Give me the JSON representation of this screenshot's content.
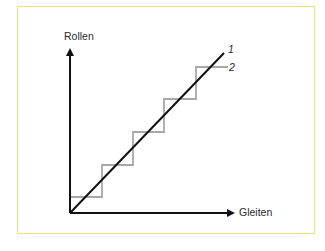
{
  "diagram": {
    "y_axis_label": "Rollen",
    "x_axis_label": "Gleiten",
    "series": [
      {
        "id": "1",
        "label": "1",
        "kind": "straight-line",
        "color": "#111111"
      },
      {
        "id": "2",
        "label": "2",
        "kind": "staircase",
        "color": "#a8a8a8",
        "steps": 5
      }
    ],
    "colors": {
      "frame_border": "#f2e27a",
      "axes": "#111111",
      "line_1": "#111111",
      "staircase_2": "#a8a8a8",
      "background": "#ffffff"
    }
  }
}
